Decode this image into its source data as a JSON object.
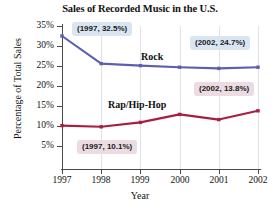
{
  "chart_data": {
    "type": "line",
    "title": "Sales of Recorded Music in the U.S.",
    "xlabel": "Year",
    "ylabel": "Percentage of Total Sales",
    "categories": [
      "1997",
      "1998",
      "1999",
      "2000",
      "2001",
      "2002"
    ],
    "x": [
      1997,
      1998,
      1999,
      2000,
      2001,
      2002
    ],
    "xlim": [
      1997,
      2002
    ],
    "ylim": [
      0,
      35
    ],
    "ytick_values": [
      5,
      10,
      15,
      20,
      25,
      30,
      35
    ],
    "ytick_labels": [
      "5%",
      "10%",
      "15%",
      "20%",
      "25%",
      "30%",
      "35%"
    ],
    "xtick_labels": [
      "1997",
      "1998",
      "1999",
      "2000",
      "2001",
      "2002"
    ],
    "grid": "vertical-only",
    "legend": "inline-series-labels",
    "series": [
      {
        "name": "Rock",
        "color": "#5b5fae",
        "values": [
          32.5,
          25.6,
          25.1,
          24.7,
          24.4,
          24.7
        ]
      },
      {
        "name": "Rap/Hip-Hop",
        "color": "#a81f42",
        "values": [
          10.1,
          9.8,
          10.9,
          12.9,
          11.6,
          13.8
        ]
      }
    ],
    "annotations": [
      {
        "id": "1997-rock",
        "text": "(1997, 32.5%)",
        "style": "blue",
        "year": 1997,
        "value": 32.5,
        "series": "Rock"
      },
      {
        "id": "2002-rock",
        "text": "(2002, 24.7%)",
        "style": "blue",
        "year": 2002,
        "value": 24.7,
        "series": "Rock"
      },
      {
        "id": "2002-rap",
        "text": "(2002, 13.8%)",
        "style": "pink",
        "year": 2002,
        "value": 13.8,
        "series": "Rap/Hip-Hop"
      },
      {
        "id": "1997-rap",
        "text": "(1997, 10.1%)",
        "style": "pink",
        "year": 1997,
        "value": 10.1,
        "series": "Rap/Hip-Hop"
      }
    ],
    "colors": {
      "rock": "#5b5fae",
      "rap": "#a81f42",
      "axis": "#4a4a4a",
      "grid": "#e2e2e6",
      "callout_blue": "#d9e6f2",
      "callout_pink": "#ecdbe3",
      "background": "#ffffff"
    }
  }
}
